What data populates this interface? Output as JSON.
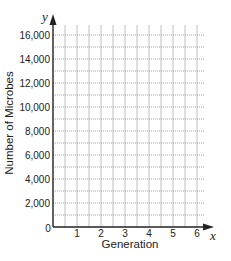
{
  "chart_data": {
    "type": "line",
    "title": "",
    "xlabel": "Generation",
    "ylabel": "Number of Microbes",
    "x_axis_variable": "x",
    "y_axis_variable": "y",
    "x_ticks": [
      "1",
      "2",
      "3",
      "4",
      "5",
      "6"
    ],
    "y_ticks": [
      "2,000",
      "4,000",
      "6,000",
      "8,000",
      "10,000",
      "12,000",
      "14,000",
      "16,000"
    ],
    "origin_label": "0",
    "xlim": [
      0,
      6.5
    ],
    "ylim": [
      0,
      16500
    ],
    "grid": true,
    "grid_minor_x": 0.5,
    "grid_minor_y": 1000,
    "series": [],
    "legend": null,
    "note": "Blank coordinate grid; no data plotted"
  },
  "colors": {
    "axis": "#222222",
    "grid_vertical": "#b8b8b8",
    "grid_horizontal": "#9a9a9a",
    "background": "#ffffff"
  }
}
